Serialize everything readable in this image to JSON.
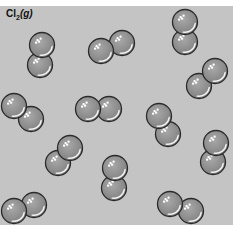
{
  "figure": {
    "label": {
      "formula": "Cl",
      "subscript": "2",
      "state": "(g)"
    },
    "background_color": "#c4c4c4",
    "atom_color": "#8e8e8e",
    "atom_outline": "#2a2a2a",
    "atom_radius": 12.5,
    "molecules": [
      {
        "id": 1,
        "atoms": [
          [
            42,
            45
          ],
          [
            40,
            65
          ]
        ]
      },
      {
        "id": 2,
        "atoms": [
          [
            101,
            51
          ],
          [
            122,
            43
          ]
        ]
      },
      {
        "id": 3,
        "atoms": [
          [
            185,
            22
          ],
          [
            185,
            42
          ]
        ]
      },
      {
        "id": 4,
        "atoms": [
          [
            215,
            71
          ],
          [
            199,
            86
          ]
        ]
      },
      {
        "id": 5,
        "atoms": [
          [
            14,
            106
          ],
          [
            31,
            119
          ]
        ]
      },
      {
        "id": 6,
        "atoms": [
          [
            88,
            109
          ],
          [
            109,
            109
          ]
        ]
      },
      {
        "id": 7,
        "atoms": [
          [
            159,
            116
          ],
          [
            168,
            134
          ]
        ]
      },
      {
        "id": 8,
        "atoms": [
          [
            216,
            143
          ],
          [
            213,
            162
          ]
        ]
      },
      {
        "id": 9,
        "atoms": [
          [
            70,
            148
          ],
          [
            58,
            163
          ]
        ]
      },
      {
        "id": 10,
        "atoms": [
          [
            115,
            168
          ],
          [
            114,
            188
          ]
        ]
      },
      {
        "id": 11,
        "atoms": [
          [
            14,
            211
          ],
          [
            34,
            205
          ]
        ]
      },
      {
        "id": 12,
        "atoms": [
          [
            170,
            204
          ],
          [
            191,
            211
          ]
        ]
      }
    ]
  }
}
